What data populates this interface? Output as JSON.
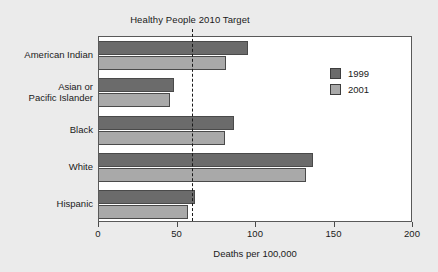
{
  "chart_data": {
    "type": "bar",
    "orientation": "horizontal",
    "title": "Healthy People 2010 Target",
    "xlabel": "Deaths per 100,000",
    "ylabel": "",
    "xlim": [
      0,
      200
    ],
    "xticks": [
      0,
      50,
      100,
      150,
      200
    ],
    "xtick_labels": [
      "0",
      "50",
      "100",
      "150",
      "200"
    ],
    "grid": false,
    "legend_position": "upper right",
    "categories": [
      "American Indian",
      "Asian or\nPacific Islander",
      "Black",
      "White",
      "Hispanic"
    ],
    "category_labels": [
      {
        "line1": "American Indian",
        "line2": ""
      },
      {
        "line1": "Asian or",
        "line2": "Pacific Islander"
      },
      {
        "line1": "Black",
        "line2": ""
      },
      {
        "line1": "White",
        "line2": ""
      },
      {
        "line1": "Hispanic",
        "line2": ""
      }
    ],
    "series": [
      {
        "name": "1999",
        "color": "#6b6b6b",
        "values": [
          95,
          48,
          86,
          136,
          61
        ]
      },
      {
        "name": "2001",
        "color": "#a9a9a9",
        "values": [
          81,
          45,
          80,
          132,
          57
        ]
      }
    ],
    "annotations": [
      {
        "name": "healthy-people-2010-target",
        "label": "Healthy People 2010 Target",
        "type": "vline",
        "value": 59,
        "style": "dashed",
        "color": "#1a1a1a"
      }
    ]
  },
  "legend": {
    "entries": [
      {
        "label": "1999",
        "color": "#6b6b6b"
      },
      {
        "label": "2001",
        "color": "#a9a9a9"
      }
    ]
  },
  "style": {
    "background": "#ebebeb",
    "plot_background": "#ffffff",
    "axis_color": "#595959"
  }
}
